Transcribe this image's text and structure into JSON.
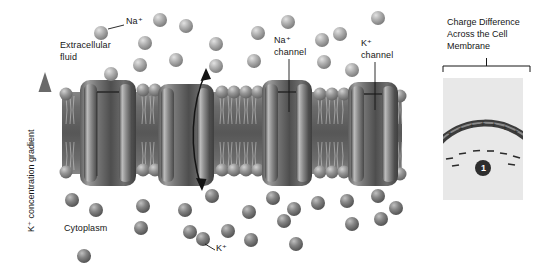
{
  "figure": {
    "title_text": "",
    "background": "#ffffff",
    "ink": "#161616"
  },
  "gradient_axis": {
    "label": "K⁺ concentration gradient",
    "direction": "up",
    "arrow_color": "#6f6f6f"
  },
  "labels": {
    "na_ion": "Na⁺",
    "extracellular_fluid": "Extracellular\nfluid",
    "extracellular_fluid_line1": "Extracellular",
    "extracellular_fluid_line2": "fluid",
    "na_channel_line1": "Na⁺",
    "na_channel_line2": "channel",
    "k_channel_line1": "K⁺",
    "k_channel_line2": "channel",
    "cytoplasm": "Cytoplasm",
    "k_ion": "K⁺"
  },
  "membrane": {
    "top_y": 80,
    "bottom_y": 186,
    "bilayer_color": "#6b6b6b",
    "head_color": "#8d8d8d",
    "channel_count": 4,
    "channels": [
      {
        "name": "channel-1",
        "x": 80,
        "width": 56
      },
      {
        "name": "channel-2",
        "x": 158,
        "width": 56
      },
      {
        "name": "na-channel",
        "x": 262,
        "width": 50
      },
      {
        "name": "k-channel",
        "x": 348,
        "width": 50
      }
    ]
  },
  "ions": {
    "extracellular_fill": "#a8a8a8",
    "cytoplasm_fill": "#7b7b7b",
    "extracellular_label": "Na⁺",
    "cytoplasm_label": "K⁺",
    "extracellular_count": 22,
    "cytoplasm_count": 24
  },
  "flux_arrow": {
    "name": "bidirectional-ion-flux-arrow",
    "color": "#1a1a1a",
    "heads": 2
  },
  "inset_panel": {
    "title": "Charge Difference\nAcross the Cell\nMembrane",
    "title_line1": "Charge Difference",
    "title_line2": "Across the Cell",
    "title_line3": "Membrane",
    "background": "#e8e8e8",
    "membrane_color": "#4a4a4a",
    "positive_symbol": "+",
    "negative_symbol": "–",
    "positive_count": 8,
    "negative_count": 7,
    "step_badge": "1",
    "badge_fill": "#2e2e2e",
    "badge_text_color": "#ffffff"
  }
}
